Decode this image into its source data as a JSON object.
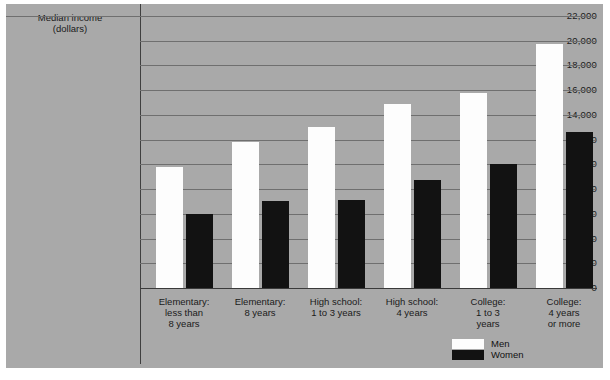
{
  "chart_data": {
    "type": "bar",
    "title": "",
    "ylabel": "Median income (dollars)",
    "xlabel": "",
    "ylim": [
      0,
      22000
    ],
    "ytick_step": 2000,
    "grid": true,
    "legend_position": "bottom-right",
    "categories": [
      "Elementary:\nless than\n8 years",
      "Elementary:\n8 years",
      "High school:\n1 to 3 years",
      "High school:\n4 years",
      "College:\n1 to 3\nyears",
      "College:\n4 years\nor more"
    ],
    "series": [
      {
        "name": "Men",
        "color": "#fdfdfd",
        "values": [
          9800,
          11800,
          13000,
          14900,
          15800,
          19700
        ]
      },
      {
        "name": "Women",
        "color": "#121212",
        "values": [
          6000,
          7000,
          7100,
          8700,
          10000,
          12600
        ]
      }
    ],
    "ytick_labels": [
      "22,000",
      "20,000",
      "18,000",
      "16,000",
      "14,000",
      "12,000",
      "10,000",
      "8,000",
      "6,000",
      "4,000",
      "2,000",
      "0"
    ],
    "ytick_values": [
      22000,
      20000,
      18000,
      16000,
      14000,
      12000,
      10000,
      8000,
      6000,
      4000,
      2000,
      0
    ]
  },
  "axis": {
    "title_line1": "Median income",
    "title_line2": "(dollars)"
  },
  "legend": {
    "items": [
      {
        "label": "Men"
      },
      {
        "label": "Women"
      }
    ]
  },
  "category_labels": [
    [
      "Elementary:",
      "less than",
      "8 years"
    ],
    [
      "Elementary:",
      "8 years"
    ],
    [
      "High school:",
      "1 to 3 years"
    ],
    [
      "High school:",
      "4 years"
    ],
    [
      "College:",
      "1 to 3",
      "years"
    ],
    [
      "College:",
      "4 years",
      "or more"
    ]
  ]
}
